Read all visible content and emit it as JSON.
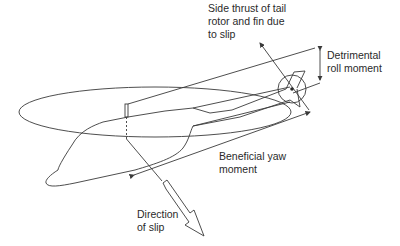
{
  "diagram": {
    "labels": {
      "side_thrust": "Side thrust of tail\nrotor and fin due\nto slip",
      "detrimental_roll": "Detrimental\nroll moment",
      "beneficial_yaw": "Beneficial yaw\nmoment",
      "direction_of_slip": "Direction\nof slip"
    },
    "colors": {
      "line": "#3a3a3a",
      "text": "#2a2a2a",
      "background": "#ffffff"
    }
  }
}
